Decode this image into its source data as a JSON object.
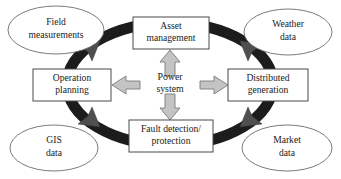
{
  "diagram": {
    "type": "hub-and-spoke cycle diagram",
    "center": {
      "label_line1": "Power",
      "label_line2": "system",
      "name": "power-system"
    },
    "ring": {
      "name": "process-ring",
      "color": "#1c1c1c",
      "shape": "ellipse"
    },
    "functions": [
      {
        "id": "asset-management",
        "line1": "Asset",
        "line2": "management",
        "position": "top"
      },
      {
        "id": "distributed-generation",
        "line1": "Distributed",
        "line2": "generation",
        "position": "right"
      },
      {
        "id": "fault-detection-protection",
        "line1": "Fault detection/",
        "line2": "protection",
        "position": "bottom"
      },
      {
        "id": "operation-planning",
        "line1": "Operation",
        "line2": "planning",
        "position": "left"
      }
    ],
    "data_sources": [
      {
        "id": "field-measurements",
        "line1": "Field",
        "line2": "measurements",
        "position": "top-left"
      },
      {
        "id": "weather-data",
        "line1": "Weather",
        "line2": "data",
        "position": "top-right"
      },
      {
        "id": "gis-data",
        "line1": "GIS",
        "line2": "data",
        "position": "bottom-left"
      },
      {
        "id": "market-data",
        "line1": "Market",
        "line2": "data",
        "position": "bottom-right"
      }
    ],
    "center_arrows": [
      {
        "id": "arrow-up",
        "direction": "up",
        "target": "asset-management"
      },
      {
        "id": "arrow-right",
        "direction": "right",
        "target": "distributed-generation"
      },
      {
        "id": "arrow-down",
        "direction": "down",
        "target": "fault-detection-protection"
      },
      {
        "id": "arrow-left",
        "direction": "left",
        "target": "operation-planning"
      }
    ],
    "colors": {
      "ring": "#1c1c1c",
      "block_arrow_fill": "#c4c4c4",
      "block_arrow_stroke": "#7a7a7a",
      "feed_arrowhead": "#4f4f4f",
      "box_stroke": "#4a4a4a",
      "ellipse_stroke": "#6b6b6b",
      "text": "#1a1a1a",
      "background": "#ffffff"
    }
  }
}
